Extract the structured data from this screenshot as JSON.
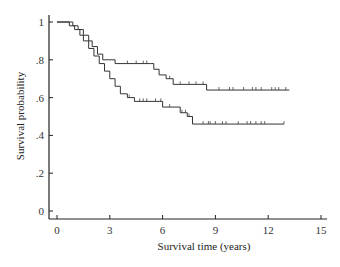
{
  "chart_data": {
    "type": "line",
    "subtype": "kaplan-meier step",
    "title": "",
    "xlabel": "Survival time (years)",
    "ylabel": "Survival probability",
    "xlim": [
      0,
      15
    ],
    "ylim": [
      0,
      1
    ],
    "xticks": [
      0,
      3,
      6,
      9,
      12,
      15
    ],
    "xtick_labels": [
      "0",
      "3",
      "6",
      "9",
      "12",
      "15"
    ],
    "yticks": [
      0,
      0.2,
      0.4,
      0.6,
      0.8,
      1
    ],
    "ytick_labels": [
      "0",
      ".2",
      ".4",
      ".6",
      ".8",
      "1"
    ],
    "grid": false,
    "legend": null,
    "series": [
      {
        "name": "upper curve",
        "steps": [
          [
            0,
            1.0
          ],
          [
            0.9,
            0.98
          ],
          [
            1.2,
            0.96
          ],
          [
            1.5,
            0.93
          ],
          [
            1.8,
            0.9
          ],
          [
            2.0,
            0.87
          ],
          [
            2.3,
            0.83
          ],
          [
            2.6,
            0.8
          ],
          [
            3.0,
            0.8
          ],
          [
            3.3,
            0.78
          ],
          [
            5.3,
            0.78
          ],
          [
            5.5,
            0.75
          ],
          [
            5.8,
            0.72
          ],
          [
            6.2,
            0.7
          ],
          [
            6.6,
            0.67
          ],
          [
            8.5,
            0.67
          ],
          [
            8.5,
            0.64
          ],
          [
            13.2,
            0.64
          ]
        ],
        "censor_times": [
          4.0,
          4.5,
          4.9,
          5.1,
          6.4,
          7.0,
          7.5,
          7.9,
          8.3,
          9.2,
          9.8,
          10.0,
          10.6,
          11.1,
          11.3,
          11.6,
          12.2,
          12.4,
          12.6,
          13.0
        ]
      },
      {
        "name": "lower curve",
        "steps": [
          [
            0,
            1.0
          ],
          [
            0.7,
            0.98
          ],
          [
            1.0,
            0.96
          ],
          [
            1.3,
            0.93
          ],
          [
            1.5,
            0.9
          ],
          [
            1.8,
            0.86
          ],
          [
            2.1,
            0.82
          ],
          [
            2.4,
            0.78
          ],
          [
            2.7,
            0.74
          ],
          [
            3.0,
            0.7
          ],
          [
            3.3,
            0.66
          ],
          [
            3.6,
            0.62
          ],
          [
            4.0,
            0.6
          ],
          [
            4.4,
            0.58
          ],
          [
            5.8,
            0.58
          ],
          [
            6.0,
            0.55
          ],
          [
            6.7,
            0.55
          ],
          [
            7.0,
            0.52
          ],
          [
            7.4,
            0.5
          ],
          [
            7.7,
            0.46
          ],
          [
            12.9,
            0.46
          ]
        ],
        "censor_times": [
          4.1,
          4.7,
          4.9,
          5.1,
          5.6,
          5.9,
          6.4,
          7.1,
          7.3,
          7.5,
          8.3,
          8.6,
          8.7,
          9.0,
          9.4,
          9.6,
          10.3,
          10.8,
          11.0,
          11.3,
          11.6,
          11.8,
          12.9
        ]
      }
    ]
  }
}
